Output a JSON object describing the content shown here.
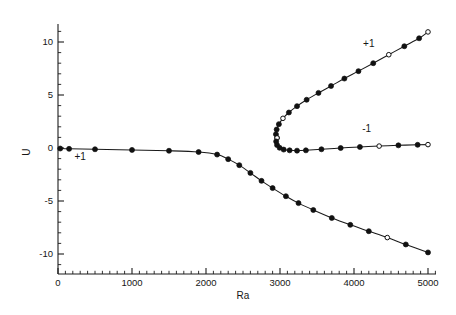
{
  "chart_data": {
    "type": "line",
    "title": "",
    "xlabel": "Ra",
    "ylabel": "U",
    "xlim": [
      0,
      5200
    ],
    "ylim": [
      -11.6,
      12.2
    ],
    "grid": false,
    "legend_position": "inline-annotations",
    "x_ticks_major": [
      0,
      1000,
      2000,
      3000,
      4000,
      5000
    ],
    "x_tick_labels": [
      "0",
      "1000",
      "2000",
      "3000",
      "4000",
      "5000"
    ],
    "x_minor_interval": 100,
    "y_ticks_major": [
      10,
      5,
      0,
      -5,
      -10
    ],
    "y_tick_labels": [
      "10",
      "5",
      "0",
      "-5",
      "-10"
    ],
    "y_minor_interval": 1,
    "annotations": [
      {
        "text": "+1",
        "x": 300,
        "y": -1.15,
        "name": "branch-label-plus-one-left"
      },
      {
        "text": "+1",
        "x": 4200,
        "y": 9.55,
        "name": "branch-label-plus-one-upper"
      },
      {
        "text": "-1",
        "x": 4170,
        "y": 1.55,
        "name": "branch-label-minus-one-lower"
      }
    ],
    "series": [
      {
        "name": "conduction-branch",
        "marker": "circle-filled",
        "points": [
          {
            "x": 30,
            "y": -0.05,
            "marker": "filled"
          },
          {
            "x": 150,
            "y": -0.08,
            "marker": "filled"
          },
          {
            "x": 500,
            "y": -0.12,
            "marker": "filled"
          },
          {
            "x": 1000,
            "y": -0.18,
            "marker": "filled"
          },
          {
            "x": 1500,
            "y": -0.26,
            "marker": "filled"
          },
          {
            "x": 1900,
            "y": -0.38,
            "marker": "filled"
          },
          {
            "x": 2150,
            "y": -0.62,
            "marker": "filled"
          },
          {
            "x": 2300,
            "y": -1.05,
            "marker": "filled"
          },
          {
            "x": 2450,
            "y": -1.62,
            "marker": "filled"
          },
          {
            "x": 2600,
            "y": -2.35,
            "marker": "filled"
          },
          {
            "x": 2750,
            "y": -3.1,
            "marker": "filled"
          },
          {
            "x": 2900,
            "y": -3.78,
            "marker": "filled"
          },
          {
            "x": 3080,
            "y": -4.55,
            "marker": "filled"
          },
          {
            "x": 3250,
            "y": -5.2,
            "marker": "filled"
          },
          {
            "x": 3450,
            "y": -5.85,
            "marker": "filled"
          },
          {
            "x": 3700,
            "y": -6.6,
            "marker": "filled"
          },
          {
            "x": 3950,
            "y": -7.25,
            "marker": "filled"
          },
          {
            "x": 4200,
            "y": -7.85,
            "marker": "filled"
          },
          {
            "x": 4450,
            "y": -8.45,
            "marker": "open"
          },
          {
            "x": 4700,
            "y": -9.1,
            "marker": "filled"
          },
          {
            "x": 5000,
            "y": -9.85,
            "marker": "filled"
          }
        ]
      },
      {
        "name": "convection-branch-upper",
        "marker": "circle-filled",
        "points": [
          {
            "x": 2960,
            "y": 0.95,
            "marker": "open"
          },
          {
            "x": 2945,
            "y": 1.3,
            "marker": "filled"
          },
          {
            "x": 2955,
            "y": 1.75,
            "marker": "filled"
          },
          {
            "x": 2985,
            "y": 2.25,
            "marker": "filled"
          },
          {
            "x": 3040,
            "y": 2.8,
            "marker": "open"
          },
          {
            "x": 3120,
            "y": 3.35,
            "marker": "filled"
          },
          {
            "x": 3230,
            "y": 3.95,
            "marker": "filled"
          },
          {
            "x": 3360,
            "y": 4.55,
            "marker": "filled"
          },
          {
            "x": 3520,
            "y": 5.2,
            "marker": "filled"
          },
          {
            "x": 3690,
            "y": 5.85,
            "marker": "filled"
          },
          {
            "x": 3870,
            "y": 6.55,
            "marker": "filled"
          },
          {
            "x": 4060,
            "y": 7.25,
            "marker": "filled"
          },
          {
            "x": 4260,
            "y": 8.0,
            "marker": "filled"
          },
          {
            "x": 4470,
            "y": 8.8,
            "marker": "open"
          },
          {
            "x": 4680,
            "y": 9.6,
            "marker": "filled"
          },
          {
            "x": 4880,
            "y": 10.35,
            "marker": "filled"
          },
          {
            "x": 5000,
            "y": 10.95,
            "marker": "open"
          }
        ]
      },
      {
        "name": "convection-branch-lower",
        "marker": "circle-filled",
        "points": [
          {
            "x": 2960,
            "y": 0.95,
            "marker": "open"
          },
          {
            "x": 2948,
            "y": 0.62,
            "marker": "filled"
          },
          {
            "x": 2960,
            "y": 0.28,
            "marker": "filled"
          },
          {
            "x": 2995,
            "y": 0.02,
            "marker": "filled"
          },
          {
            "x": 3050,
            "y": -0.15,
            "marker": "filled"
          },
          {
            "x": 3130,
            "y": -0.22,
            "marker": "filled"
          },
          {
            "x": 3230,
            "y": -0.25,
            "marker": "filled"
          },
          {
            "x": 3350,
            "y": -0.22,
            "marker": "filled"
          },
          {
            "x": 3560,
            "y": -0.12,
            "marker": "filled"
          },
          {
            "x": 3820,
            "y": 0.0,
            "marker": "filled"
          },
          {
            "x": 4080,
            "y": 0.1,
            "marker": "filled"
          },
          {
            "x": 4340,
            "y": 0.18,
            "marker": "open"
          },
          {
            "x": 4600,
            "y": 0.25,
            "marker": "filled"
          },
          {
            "x": 4860,
            "y": 0.3,
            "marker": "filled"
          },
          {
            "x": 5000,
            "y": 0.32,
            "marker": "open"
          }
        ]
      }
    ]
  },
  "geometry": {
    "plot_left_px": 58,
    "plot_right_px": 428,
    "y_zero_px": 148,
    "px_per_unit_y": 10.6,
    "px_per_x": 0.074
  }
}
